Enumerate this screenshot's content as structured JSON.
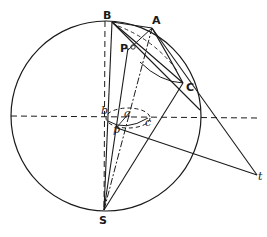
{
  "diagram": {
    "type": "geometric-projection",
    "colors": {
      "stroke": "#1a1a1a",
      "background": "#ffffff"
    },
    "labels": {
      "B": "B",
      "A": "A",
      "P": "P",
      "C": "C",
      "b": "b",
      "a": "a",
      "c": "c",
      "p": "p",
      "t": "t",
      "S": "S"
    },
    "points": {
      "B": [
        112,
        22
      ],
      "A": [
        152,
        28
      ],
      "C": [
        183,
        83
      ],
      "P": [
        128,
        48
      ],
      "S": [
        104,
        210
      ],
      "t": [
        257,
        175
      ],
      "b": [
        105,
        116
      ],
      "a": [
        125,
        113
      ],
      "c": [
        148,
        118
      ],
      "p": [
        117,
        127
      ]
    },
    "circle": {
      "cx": 106,
      "cy": 116,
      "r": 95
    }
  }
}
